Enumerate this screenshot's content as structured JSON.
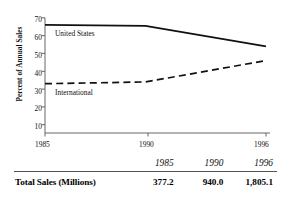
{
  "chart_data": {
    "type": "line",
    "title": "",
    "xlabel": "",
    "ylabel": "Percent of Annual Sales",
    "x": [
      1985,
      1990,
      1996
    ],
    "xlim": [
      1985,
      1996
    ],
    "ylim": [
      0,
      70
    ],
    "grid": false,
    "legend_position": "inline-labels",
    "x_tick_labels": [
      "1985",
      "1990",
      "1996"
    ],
    "y_tick_labels": [
      "10",
      "20",
      "30",
      "40",
      "50",
      "60",
      "70"
    ],
    "y_ticks": [
      10,
      20,
      30,
      40,
      50,
      60,
      70
    ],
    "series": [
      {
        "name": "United States",
        "style": "solid",
        "color": "#111111",
        "values": [
          66,
          65.5,
          54
        ]
      },
      {
        "name": "International",
        "style": "dashed",
        "color": "#111111",
        "values": [
          33,
          34,
          46
        ]
      }
    ],
    "annotations": [
      {
        "text": "United States",
        "x": 1986.1,
        "y": 61.5
      },
      {
        "text": "International",
        "x": 1986.1,
        "y": 28.0
      }
    ]
  },
  "table": {
    "year_headers": [
      "1985",
      "1990",
      "1996"
    ],
    "rows": [
      {
        "label": "Total Sales (Millions)",
        "values": [
          "377.2",
          "940.0",
          "1,805.1"
        ]
      }
    ]
  }
}
